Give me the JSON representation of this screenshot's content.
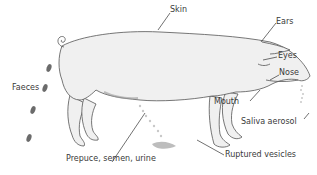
{
  "diagram": {
    "colors": {
      "body_fill": "#f0f0f0",
      "outline": "#555555",
      "faeces": "#6b6b6b",
      "arrow": "#333333",
      "label": "#3a3a3a"
    },
    "labels": {
      "skin": "Skin",
      "ears": "Ears",
      "eyes": "Eyes",
      "nose": "Nose",
      "mouth": "Mouth",
      "saliva": "Saliva aerosol",
      "faeces": "Faeces",
      "prepuce": "Prepuce, semen, urine",
      "vesicles": "Ruptured vesicles"
    }
  }
}
